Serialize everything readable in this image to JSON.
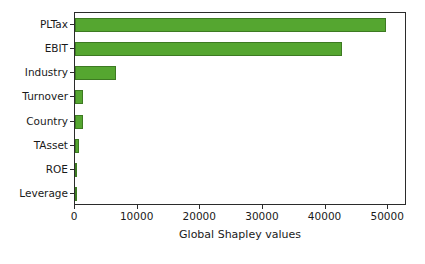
{
  "chart_data": {
    "type": "bar",
    "orientation": "horizontal",
    "title": "",
    "xlabel": "Global Shapley values",
    "ylabel": "",
    "categories": [
      "PLTax",
      "EBIT",
      "Industry",
      "Turnover",
      "Country",
      "TAsset",
      "ROE",
      "Leverage"
    ],
    "values": [
      49600,
      42700,
      6600,
      1350,
      1250,
      700,
      350,
      120
    ],
    "xlim": [
      0,
      53000
    ],
    "xticks": [
      0,
      10000,
      20000,
      30000,
      40000,
      50000
    ],
    "xticklabels": [
      "0",
      "10000",
      "20000",
      "30000",
      "40000",
      "50000"
    ],
    "grid": false,
    "legend": null,
    "bar_color": "#55a630",
    "bar_edge_color": "#3d7a22"
  }
}
